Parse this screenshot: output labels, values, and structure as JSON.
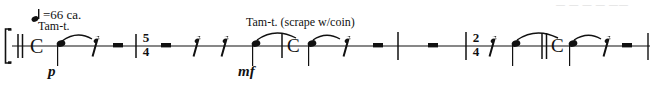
{
  "page": {
    "type": "music-notation-excerpt",
    "width": 657,
    "height": 89,
    "background": "#ffffff",
    "ink_color": "#111111"
  },
  "tempo": {
    "note_glyph": "quarter-note",
    "text": "=66 ca.",
    "full_text": "♩=66 ca.",
    "bpm": 66
  },
  "ghost_text": {
    "visible_fragment": "— — — —  ——",
    "note": "faint clipped text row from line above"
  },
  "staff": {
    "lines": 1,
    "y": 46,
    "x_start": 12,
    "x_end": 650,
    "bracket": {
      "label": "bracket",
      "x": 6,
      "y_top": 30,
      "y_bottom": 62
    },
    "opening_barline": {
      "type": "double-thin",
      "x": 20
    }
  },
  "instrument_labels": [
    {
      "text": "Tam-t.",
      "x": 38,
      "y": 20
    },
    {
      "text": "Tam-t. (scrape w/coin)",
      "x": 246,
      "y": 16
    }
  ],
  "dynamics": [
    {
      "text": "p",
      "x": 48,
      "y": 64
    },
    {
      "text": "mf",
      "x": 238,
      "y": 64
    }
  ],
  "time_signatures": [
    {
      "numerator": "5",
      "denominator": "4",
      "x": 140
    },
    {
      "numerator": "2",
      "denominator": "4",
      "x": 470
    }
  ],
  "common_time_symbols": [
    {
      "glyph": "C",
      "x": 33,
      "role": "common-time"
    },
    {
      "glyph": "C",
      "x": 289,
      "role": "common-time"
    },
    {
      "glyph": "C",
      "x": 553,
      "role": "common-time"
    }
  ],
  "barlines": [
    {
      "type": "double-thin",
      "x": 20
    },
    {
      "type": "single",
      "x": 136
    },
    {
      "type": "single",
      "x": 282
    },
    {
      "type": "single",
      "x": 398
    },
    {
      "type": "single",
      "x": 466
    },
    {
      "type": "double-thin",
      "x": 545
    },
    {
      "type": "single",
      "x": 648
    }
  ],
  "notes": [
    {
      "id": "note-1",
      "x": 61,
      "stem": "down",
      "tie": "start",
      "dynamic": "p"
    },
    {
      "id": "note-2",
      "x": 232,
      "stem": "down",
      "tie": "start",
      "dynamic": "mf"
    },
    {
      "id": "note-3",
      "x": 312,
      "stem": "down",
      "tie": "start"
    },
    {
      "id": "note-4",
      "x": 573,
      "stem": "down",
      "tie": "start"
    }
  ],
  "ties": [
    {
      "from": 61,
      "to": 93
    },
    {
      "from": 232,
      "to": 292
    },
    {
      "from": 312,
      "to": 345
    },
    {
      "from": 510,
      "to": 573
    },
    {
      "from": 573,
      "to": 605
    }
  ],
  "rests": [
    {
      "type": "eighth-rest",
      "x": 92
    },
    {
      "type": "quarter-rest-bar",
      "x": 118
    },
    {
      "type": "quarter-rest-bar",
      "x": 166
    },
    {
      "type": "eighth-rest",
      "x": 194
    },
    {
      "type": "eighth-rest",
      "x": 222
    },
    {
      "type": "eighth-rest",
      "x": 344
    },
    {
      "type": "quarter-rest-bar",
      "x": 378
    },
    {
      "type": "quarter-rest-bar",
      "x": 432
    },
    {
      "type": "eighth-rest",
      "x": 494
    },
    {
      "type": "eighth-rest",
      "x": 604
    },
    {
      "type": "quarter-rest-bar",
      "x": 626
    }
  ]
}
